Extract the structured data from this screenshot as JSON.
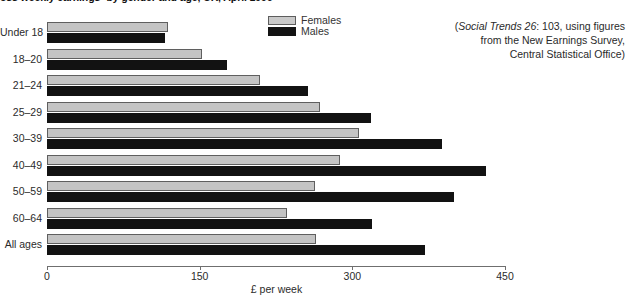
{
  "chart_data": {
    "type": "bar",
    "orientation": "horizontal",
    "title": "oss weekly earnings¹ by gender and age, UK, April 1996",
    "categories": [
      "Under 18",
      "18–20",
      "21–24",
      "25–29",
      "30–39",
      "40–49",
      "50–59",
      "60–64",
      "All ages"
    ],
    "series": [
      {
        "name": "Females",
        "color": "#c4c4c4",
        "values": [
          119,
          152,
          209,
          268,
          307,
          288,
          263,
          236,
          264
        ]
      },
      {
        "name": "Males",
        "color": "#121212",
        "values": [
          116,
          177,
          256,
          318,
          388,
          431,
          400,
          319,
          371
        ]
      }
    ],
    "xlabel": "£ per week",
    "ylabel": "",
    "xlim": [
      0,
      450
    ],
    "xticks": [
      0,
      150,
      300,
      450
    ],
    "xtick_labels": [
      "0",
      "150",
      "300",
      "450"
    ],
    "grid": false,
    "legend_position": "top-center"
  },
  "legend": {
    "entries": [
      {
        "label": "Females",
        "swatch": "females"
      },
      {
        "label": "Males",
        "swatch": "males"
      }
    ]
  },
  "source_note": {
    "line1_italic": "Social Trends 26",
    "line1_rest": ": 103, using figures",
    "line2": "from the New Earnings Survey,",
    "line3": "Central Statistical Office)",
    "open_paren": "("
  }
}
